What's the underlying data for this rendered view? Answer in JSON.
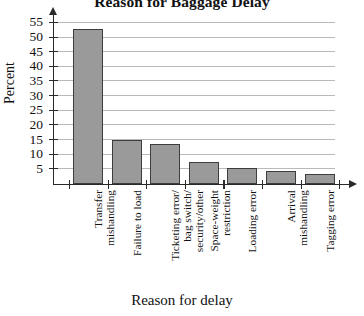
{
  "chart_data": {
    "type": "bar",
    "title": "Reason for Baggage Delay",
    "xlabel": "Reason for delay",
    "ylabel": "Percent",
    "categories": [
      "Transfer mishandling",
      "Failure to load",
      "Ticketing error/ bag switch/ security/other",
      "Space-weight restriction",
      "Loading error",
      "Arrival mishandling",
      "Tagging error"
    ],
    "category_lines": [
      [
        "Transfer",
        "mishandling"
      ],
      [
        "Failure to load"
      ],
      [
        "Ticketing error/",
        "bag switch/",
        "security/other"
      ],
      [
        "Space-weight",
        "restriction"
      ],
      [
        "Loading error"
      ],
      [
        "Arrival",
        "mishandling"
      ],
      [
        "Tagging error"
      ]
    ],
    "values": [
      53,
      15,
      13.5,
      7.5,
      5.5,
      4.5,
      3.5
    ],
    "ylim": [
      0,
      57
    ],
    "yticks": [
      5,
      10,
      15,
      20,
      25,
      30,
      35,
      40,
      45,
      50,
      55
    ],
    "ytick_labels": [
      "5",
      "10",
      "15",
      "20",
      "25",
      "30",
      "35",
      "40",
      "45",
      "50",
      "55"
    ],
    "grid": true,
    "grid_axis": "y",
    "legend": "none",
    "bar_color": "#9a9a9a",
    "bar_edge_color": "#3d3d3d",
    "grid_color": "#b9b9b9",
    "axis_color": "#2a2a2a"
  }
}
